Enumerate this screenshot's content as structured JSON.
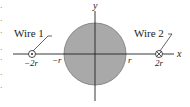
{
  "diagram": {
    "axes": {
      "x_label": "x",
      "y_label": "y"
    },
    "conductor": {
      "shape": "circle",
      "fill": "#a9a9a9",
      "stroke": "#666666",
      "label_neg": "−r",
      "label_pos": "r"
    },
    "wires": [
      {
        "name": "Wire 1",
        "position_label": "−2r",
        "current_direction": "out-of-page",
        "symbol": "dot"
      },
      {
        "name": "Wire 2",
        "position_label": "2r",
        "current_direction": "into-page",
        "symbol": "cross"
      }
    ],
    "margin_fragments": [
      "r",
      "t",
      "f",
      "s",
      "t",
      "s",
      "d",
      "i"
    ]
  }
}
